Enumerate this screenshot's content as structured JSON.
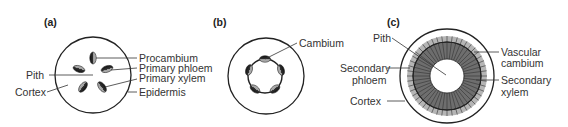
{
  "colors": {
    "outline": "#222222",
    "label": "#333333",
    "secondary_phloem": "#b5b5b5",
    "secondary_xylem": "#6e6e6e",
    "pith": "#ffffff",
    "bundle_dark": "#222222",
    "bundle_light": "#9a9a9a"
  },
  "panels": [
    {
      "id": "a",
      "label": "(a)",
      "labels": {
        "procambium": "Procambium",
        "primary_phloem": "Primary phloem",
        "primary_xylem": "Primary xylem",
        "epidermis": "Epidermis",
        "pith": "Pith",
        "cortex": "Cortex"
      }
    },
    {
      "id": "b",
      "label": "(b)",
      "labels": {
        "cambium": "Cambium"
      }
    },
    {
      "id": "c",
      "label": "(c)",
      "labels": {
        "pith": "Pith",
        "secondary_phloem_1": "Secondary",
        "secondary_phloem_2": "phloem",
        "cortex": "Cortex",
        "vascular_cambium_1": "Vascular",
        "vascular_cambium_2": "cambium",
        "secondary_xylem_1": "Secondary",
        "secondary_xylem_2": "xylem"
      }
    }
  ]
}
